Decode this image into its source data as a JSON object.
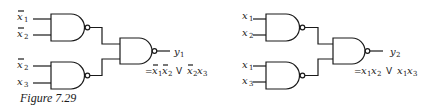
{
  "figure": {
    "caption": "Figure 7.29",
    "circuits": [
      {
        "id": "left",
        "gate_type": "NAND",
        "gate1_inputs": [
          {
            "var": "x",
            "sub": "1",
            "complement": true
          },
          {
            "var": "x",
            "sub": "2",
            "complement": true
          }
        ],
        "gate2_inputs": [
          {
            "var": "x",
            "sub": "2",
            "complement": true
          },
          {
            "var": "x",
            "sub": "3",
            "complement": false
          }
        ],
        "output": {
          "var": "y",
          "sub": "1"
        },
        "expression": "= x̄1x̄2 V x̄2x3"
      },
      {
        "id": "right",
        "gate_type": "NAND",
        "gate1_inputs": [
          {
            "var": "x",
            "sub": "1",
            "complement": false
          },
          {
            "var": "x",
            "sub": "2",
            "complement": false
          }
        ],
        "gate2_inputs": [
          {
            "var": "x",
            "sub": "1",
            "complement": false
          },
          {
            "var": "x",
            "sub": "3",
            "complement": false
          }
        ],
        "output": {
          "var": "y",
          "sub": "2"
        },
        "expression": "= x1x2 V x1x3"
      }
    ],
    "text": {
      "x": "x",
      "y": "y",
      "s1": "1",
      "s2": "2",
      "s3": "3",
      "eq": "=",
      "or": "V"
    }
  }
}
